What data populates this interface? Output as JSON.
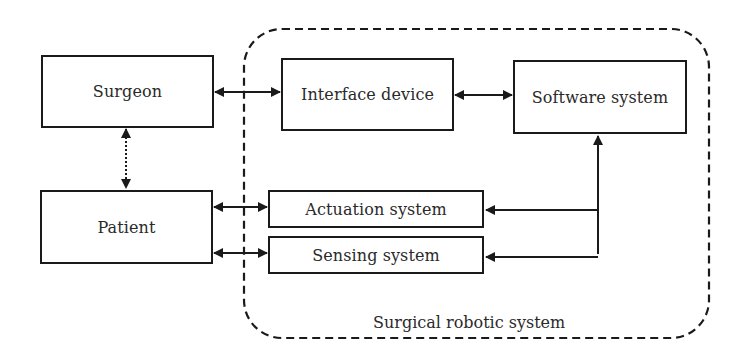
{
  "diagram": {
    "nodes": {
      "surgeon": "Surgeon",
      "interface_device": "Interface device",
      "software_system": "Software system",
      "patient": "Patient",
      "actuation_system": "Actuation system",
      "sensing_system": "Sensing system"
    },
    "group_label": "Surgical robotic system",
    "edges": [
      {
        "from": "Surgeon",
        "to": "Interface device",
        "style": "solid",
        "direction": "bidirectional"
      },
      {
        "from": "Interface device",
        "to": "Software system",
        "style": "solid",
        "direction": "bidirectional"
      },
      {
        "from": "Surgeon",
        "to": "Patient",
        "style": "dotted",
        "direction": "bidirectional"
      },
      {
        "from": "Patient",
        "to": "Actuation system",
        "style": "solid",
        "direction": "bidirectional"
      },
      {
        "from": "Patient",
        "to": "Sensing system",
        "style": "solid",
        "direction": "bidirectional"
      },
      {
        "from": "Software system",
        "to": "Actuation system",
        "style": "solid",
        "direction": "to"
      },
      {
        "from": "Sensing system",
        "to": "Software system",
        "style": "solid",
        "direction": "to"
      }
    ],
    "colors": {
      "stroke": "#1a1a1a",
      "background": "#ffffff"
    }
  }
}
